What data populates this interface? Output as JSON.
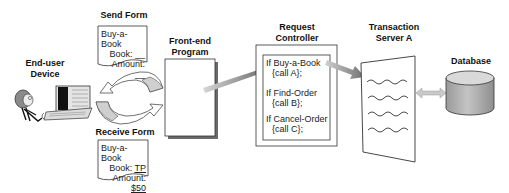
{
  "diagram": {
    "nodes": {
      "end_user_device": {
        "label_line1": "End-user",
        "label_line2": "Device"
      },
      "send_form": {
        "title": "Send Form",
        "line1": "Buy-a-Book",
        "line2_label": "Book:",
        "line2_value": "__",
        "line3_label": "Amount:",
        "line3_value": "__"
      },
      "receive_form": {
        "title": "Receive Form",
        "line1": "Buy-a-Book",
        "line2_label": "Book:",
        "line2_value": "TP",
        "line3_label": "Amount:",
        "line3_value": "$50"
      },
      "front_end_program": {
        "label_line1": "Front-end",
        "label_line2": "Program"
      },
      "request_controller": {
        "label_line1": "Request",
        "label_line2": "Controller",
        "rules": [
          {
            "condition": "If Buy-a-Book",
            "action": "{call  A};"
          },
          {
            "condition": "If Find-Order",
            "action": "{call  B};"
          },
          {
            "condition": "If Cancel-Order",
            "action": "{call C};"
          }
        ]
      },
      "transaction_server": {
        "label_line1": "Transaction",
        "label_line2": "Server A"
      },
      "database": {
        "label": "Database"
      }
    },
    "edges": [
      {
        "from": "end_user_device",
        "to": "front_end_program",
        "type": "cycle-arrows"
      },
      {
        "from": "front_end_program",
        "to": "request_controller",
        "type": "arrow"
      },
      {
        "from": "request_controller",
        "to": "transaction_server",
        "type": "arrow"
      },
      {
        "from": "transaction_server",
        "to": "database",
        "type": "double-arrow"
      }
    ],
    "colors": {
      "outline": "#333333",
      "arrow_dark": "#6e6e6e",
      "arrow_light": "#c8c8c8",
      "db_fill": "#b5b5b5",
      "db_top": "#d8d8d8"
    }
  }
}
